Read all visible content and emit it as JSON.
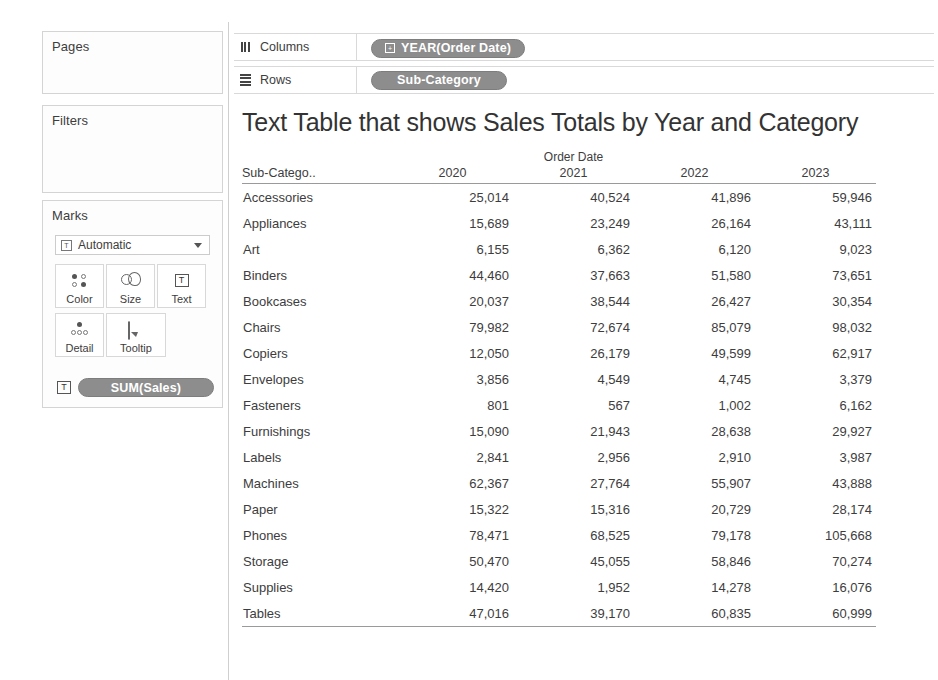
{
  "left_panel": {
    "pages": {
      "title": "Pages"
    },
    "filters": {
      "title": "Filters"
    },
    "marks": {
      "title": "Marks",
      "type_select": {
        "value": "Automatic",
        "icon": "mark-type-icon",
        "caret": "chevron-down-icon"
      },
      "buttons": [
        {
          "label": "Color",
          "icon": "color-dots-icon"
        },
        {
          "label": "Size",
          "icon": "size-circles-icon"
        },
        {
          "label": "Text",
          "icon": "text-box-icon"
        },
        {
          "label": "Detail",
          "icon": "detail-dots-icon"
        },
        {
          "label": "Tooltip",
          "icon": "tooltip-bubble-icon"
        }
      ],
      "measure_pill": {
        "label": "SUM(Sales)",
        "icon": "text-box-icon",
        "color": "#8d8d8d"
      }
    }
  },
  "shelves": {
    "columns": {
      "label": "Columns",
      "icon": "columns-bars-icon",
      "pill": {
        "label": "YEAR(Order Date)",
        "icon": "plus-box-icon",
        "color": "#8d8d8d"
      }
    },
    "rows": {
      "label": "Rows",
      "icon": "rows-lines-icon",
      "pill": {
        "label": "Sub-Category",
        "color": "#8d8d8d"
      }
    }
  },
  "view": {
    "title": "Text Table that shows Sales Totals by Year and Category"
  },
  "chart_data": {
    "type": "table",
    "title": "Text Table that shows Sales Totals by Year and Category",
    "column_super_header": "Order Date",
    "row_header": "Sub-Catego..",
    "categories_label": "Sub-Category",
    "columns": [
      "2020",
      "2021",
      "2022",
      "2023"
    ],
    "rows": [
      {
        "category": "Accessories",
        "values": [
          "25,014",
          "40,524",
          "41,896",
          "59,946"
        ]
      },
      {
        "category": "Appliances",
        "values": [
          "15,689",
          "23,249",
          "26,164",
          "43,111"
        ]
      },
      {
        "category": "Art",
        "values": [
          "6,155",
          "6,362",
          "6,120",
          "9,023"
        ]
      },
      {
        "category": "Binders",
        "values": [
          "44,460",
          "37,663",
          "51,580",
          "73,651"
        ]
      },
      {
        "category": "Bookcases",
        "values": [
          "20,037",
          "38,544",
          "26,427",
          "30,354"
        ]
      },
      {
        "category": "Chairs",
        "values": [
          "79,982",
          "72,674",
          "85,079",
          "98,032"
        ]
      },
      {
        "category": "Copiers",
        "values": [
          "12,050",
          "26,179",
          "49,599",
          "62,917"
        ]
      },
      {
        "category": "Envelopes",
        "values": [
          "3,856",
          "4,549",
          "4,745",
          "3,379"
        ]
      },
      {
        "category": "Fasteners",
        "values": [
          "801",
          "567",
          "1,002",
          "6,162"
        ]
      },
      {
        "category": "Furnishings",
        "values": [
          "15,090",
          "21,943",
          "28,638",
          "29,927"
        ]
      },
      {
        "category": "Labels",
        "values": [
          "2,841",
          "2,956",
          "2,910",
          "3,987"
        ]
      },
      {
        "category": "Machines",
        "values": [
          "62,367",
          "27,764",
          "55,907",
          "43,888"
        ]
      },
      {
        "category": "Paper",
        "values": [
          "15,322",
          "15,316",
          "20,729",
          "28,174"
        ]
      },
      {
        "category": "Phones",
        "values": [
          "78,471",
          "68,525",
          "79,178",
          "105,668"
        ]
      },
      {
        "category": "Storage",
        "values": [
          "50,470",
          "45,055",
          "58,846",
          "70,274"
        ]
      },
      {
        "category": "Supplies",
        "values": [
          "14,420",
          "1,952",
          "14,278",
          "16,076"
        ]
      },
      {
        "category": "Tables",
        "values": [
          "47,016",
          "39,170",
          "60,835",
          "60,999"
        ]
      }
    ],
    "measure": "SUM(Sales)",
    "xlabel": "Order Date",
    "ylabel": "Sub-Category"
  }
}
